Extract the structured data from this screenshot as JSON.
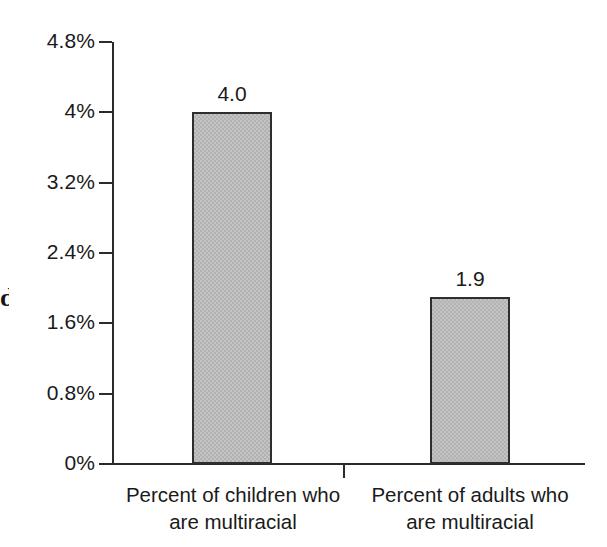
{
  "chart_data": {
    "type": "bar",
    "title": "",
    "subtitle": "",
    "xlabel": "",
    "ylabel": "",
    "categories": [
      "Percent of children who are multiracial",
      "Percent of adults who are multiracial"
    ],
    "category_lines": [
      [
        "Percent of children who",
        "are multiracial"
      ],
      [
        "Percent of adults who",
        "are multiracial"
      ]
    ],
    "values": [
      4.0,
      1.9
    ],
    "value_labels": [
      "4.0",
      "1.9"
    ],
    "ylim": [
      0,
      4.8
    ],
    "ytick_values": [
      0,
      0.8,
      1.6,
      2.4,
      3.2,
      4.0,
      4.8
    ],
    "ytick_labels": [
      "0%",
      "0.8%",
      "1.6%",
      "2.4%",
      "3.2%",
      "4%",
      "4.8%"
    ],
    "grid": false,
    "legend": null,
    "legend_position": "none",
    "series": [
      {
        "name": "",
        "values": [
          4.0,
          1.9
        ]
      }
    ],
    "colors": {
      "bar_fill": "#c3c3c3",
      "bar_pattern": "#b2b2b2",
      "bar_border": "#2e2e2e",
      "axis": "#2b2b2b",
      "text": "#1a1a1a",
      "background": "#ffffff"
    }
  },
  "artifacts": {
    "left_edge_glyph": "d"
  }
}
